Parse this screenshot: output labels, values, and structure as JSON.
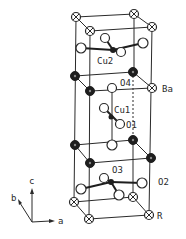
{
  "figure": {
    "labels": {
      "cu2": "Cu2",
      "o4": "O4",
      "ba": "Ba",
      "cu1": "Cu1",
      "o1": "O1",
      "o3": "O3",
      "o2": "O2",
      "r": "R"
    },
    "axes": {
      "c": "c",
      "b": "b",
      "a": "a"
    }
  },
  "colors": {
    "line": "#2a2a2a",
    "open_atom_fill": "#ffffff",
    "filled_atom": "#1e1e1e",
    "background": "#ffffff"
  },
  "legend_atoms": {
    "crossed_circle": "R",
    "filled_circle": "Ba / Cu",
    "open_circle": "O"
  }
}
